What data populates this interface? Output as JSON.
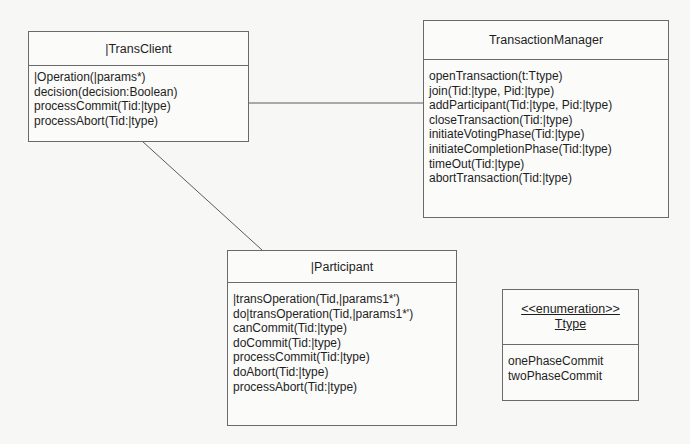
{
  "diagram": {
    "type": "uml-class-diagram",
    "classes": [
      {
        "id": "transclient",
        "name": "|TransClient",
        "operations": [
          "|Operation(|params*)",
          "decision(decision:Boolean)",
          "processCommit(Tid:|type)",
          "processAbort(Tid:|type)"
        ]
      },
      {
        "id": "transactionmanager",
        "name": "TransactionManager",
        "operations": [
          "openTransaction(t:Ttype)",
          "join(Tid:|type, Pid:|type)",
          "addParticipant(Tid:|type, Pid:|type)",
          "closeTransaction(Tid:|type)",
          "initiateVotingPhase(Tid:|type)",
          "initiateCompletionPhase(Tid:|type)",
          "timeOut(Tid:|type)",
          "abortTransaction(Tid:|type)"
        ]
      },
      {
        "id": "participant",
        "name": "|Participant",
        "operations": [
          "|transOperation(Tid,|params1*')",
          "do|transOperation(Tid,|params1*')",
          "canCommit(Tid:|type)",
          "doCommit(Tid:|type)",
          "processCommit(Tid:|type)",
          "doAbort(Tid:|type)",
          "processAbort(Tid:|type)"
        ]
      }
    ],
    "enumeration": {
      "stereotype": "<<enumeration>>",
      "name": "Ttype",
      "literals": [
        "onePhaseCommit",
        "twoPhaseCommit"
      ]
    },
    "associations": [
      {
        "from": "transclient",
        "to": "transactionmanager"
      },
      {
        "from": "transclient",
        "to": "participant"
      }
    ]
  }
}
